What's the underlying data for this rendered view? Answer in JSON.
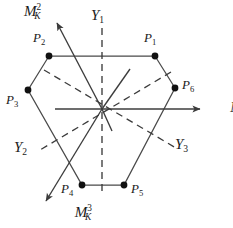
{
  "figure": {
    "width": 233,
    "height": 228,
    "background": "#ffffff",
    "line_color": "#3c3c3c",
    "dash_color": "#3c3c3c",
    "dot_color": "#111111",
    "text_color": "#1a1a1a"
  },
  "axes": [
    {
      "id": "mk1",
      "base": "M",
      "sub": "K",
      "sup": "1",
      "label_x": 203,
      "label_y": 98,
      "style": "solid-arrow",
      "direction": "right"
    },
    {
      "id": "mk2",
      "base": "M",
      "sub": "K",
      "sup": "2",
      "label_x": 24,
      "label_y": 2,
      "style": "solid-arrow",
      "direction": "up-left"
    },
    {
      "id": "mk3",
      "base": "M",
      "sub": "K",
      "sup": "3",
      "label_x": 20,
      "label_y": 203,
      "style": "solid-arrow",
      "direction": "down-left"
    }
  ],
  "y_axes": [
    {
      "id": "y1",
      "base": "Y",
      "sub": "1",
      "label_x": 91,
      "label_y": 8,
      "style": "dashed",
      "orientation": "vertical"
    },
    {
      "id": "y2",
      "base": "Y",
      "sub": "2",
      "label_x": 14,
      "label_y": 140,
      "style": "dashed",
      "orientation": "diagonal-nesw"
    },
    {
      "id": "y3",
      "base": "Y",
      "sub": "3",
      "label_x": 175,
      "label_y": 137,
      "style": "dashed",
      "orientation": "diagonal-nwse"
    }
  ],
  "points": [
    {
      "id": "p1",
      "base": "P",
      "sub": "1",
      "cx": 155,
      "cy": 56,
      "label_x": 144,
      "label_y": 31
    },
    {
      "id": "p2",
      "base": "P",
      "sub": "2",
      "cx": 49,
      "cy": 56,
      "label_x": 33,
      "label_y": 31
    },
    {
      "id": "p3",
      "base": "P",
      "sub": "3",
      "cx": 28,
      "cy": 90,
      "label_x": 6,
      "label_y": 93
    },
    {
      "id": "p4",
      "base": "P",
      "sub": "4",
      "cx": 82,
      "cy": 185,
      "label_x": 61,
      "label_y": 182
    },
    {
      "id": "p5",
      "base": "P",
      "sub": "5",
      "cx": 124,
      "cy": 185,
      "label_x": 131,
      "label_y": 182
    },
    {
      "id": "p6",
      "base": "P",
      "sub": "6",
      "cx": 175,
      "cy": 88,
      "label_x": 182,
      "label_y": 78
    }
  ],
  "geometry": {
    "center_x": 102,
    "center_y": 109,
    "hexagon_order": [
      "p1",
      "p2",
      "p3",
      "p4",
      "p5",
      "p6"
    ],
    "mk1_arrow_end_x": 200,
    "mk1_arrow_end_y": 109,
    "mk2_arrow_end_x": 57,
    "mk2_arrow_end_y": 23,
    "mk3_arrow_end_x": 46,
    "mk3_arrow_end_y": 201,
    "y1_top_y": 28,
    "y1_bottom_y": 196,
    "spoke_upright_end_x": 130,
    "spoke_upright_end_y": 69,
    "spoke_downleft_end_x": 112,
    "spoke_downleft_end_y": 131
  }
}
